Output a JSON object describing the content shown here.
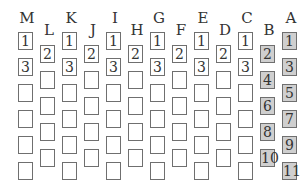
{
  "diagram": {
    "colors": {
      "border": "#6f6f6f",
      "shaded_fill": "#cfcfcf",
      "text": "#333333"
    },
    "columns": [
      {
        "label": "M",
        "offset": "high",
        "boxes": [
          "1",
          "3",
          "",
          "",
          "",
          ""
        ],
        "shaded": false
      },
      {
        "label": "L",
        "offset": "low",
        "boxes": [
          "2",
          "",
          "",
          "",
          ""
        ],
        "shaded": false
      },
      {
        "label": "K",
        "offset": "high",
        "boxes": [
          "1",
          "3",
          "",
          "",
          "",
          ""
        ],
        "shaded": false
      },
      {
        "label": "J",
        "offset": "low",
        "boxes": [
          "2",
          "",
          "",
          "",
          ""
        ],
        "shaded": false
      },
      {
        "label": "I",
        "offset": "high",
        "boxes": [
          "1",
          "3",
          "",
          "",
          "",
          ""
        ],
        "shaded": false
      },
      {
        "label": "H",
        "offset": "low",
        "boxes": [
          "2",
          "",
          "",
          "",
          ""
        ],
        "shaded": false
      },
      {
        "label": "G",
        "offset": "high",
        "boxes": [
          "1",
          "3",
          "",
          "",
          "",
          ""
        ],
        "shaded": false
      },
      {
        "label": "F",
        "offset": "low",
        "boxes": [
          "2",
          "",
          "",
          "",
          ""
        ],
        "shaded": false
      },
      {
        "label": "E",
        "offset": "high",
        "boxes": [
          "1",
          "3",
          "",
          "",
          "",
          ""
        ],
        "shaded": false
      },
      {
        "label": "D",
        "offset": "low",
        "boxes": [
          "2",
          "",
          "",
          "",
          ""
        ],
        "shaded": false
      },
      {
        "label": "C",
        "offset": "high",
        "boxes": [
          "1",
          "3",
          "",
          "",
          "",
          ""
        ],
        "shaded": false
      },
      {
        "label": "B",
        "offset": "low",
        "boxes": [
          "2",
          "4",
          "6",
          "8",
          "10"
        ],
        "shaded": true
      },
      {
        "label": "A",
        "offset": "high",
        "boxes": [
          "1",
          "3",
          "5",
          "7",
          "9",
          "11"
        ],
        "shaded": true
      }
    ]
  }
}
